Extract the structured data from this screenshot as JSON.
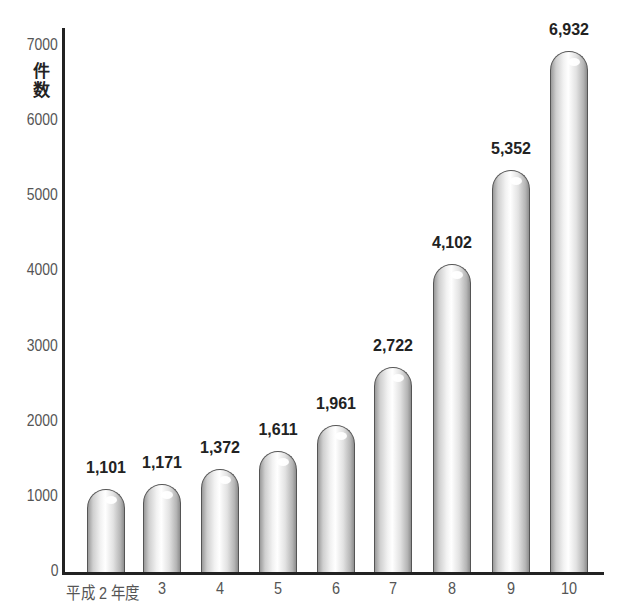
{
  "chart_data": {
    "type": "bar",
    "title": "",
    "xlabel": "",
    "ylabel": "件数",
    "ylim": [
      0,
      7000
    ],
    "yticks": [
      0,
      1000,
      2000,
      3000,
      4000,
      5000,
      6000,
      7000
    ],
    "categories": [
      "平成2年度",
      "3",
      "4",
      "5",
      "6",
      "7",
      "8",
      "9",
      "10"
    ],
    "values": [
      1101,
      1171,
      1372,
      1611,
      1961,
      2722,
      4102,
      5352,
      6932
    ],
    "value_labels": [
      "1,101",
      "1,171",
      "1,372",
      "1,611",
      "1,961",
      "2,722",
      "4,102",
      "5,352",
      "6,932"
    ],
    "grid": false,
    "legend": null,
    "style": "rounded cylindrical gray bars"
  },
  "axis": {
    "ylabel_chars": [
      "件",
      "数"
    ],
    "ytick_labels": [
      "0",
      "1000",
      "2000",
      "3000",
      "4000",
      "5000",
      "6000",
      "7000"
    ],
    "xtick_labels": [
      "平成 2 年度",
      "3",
      "4",
      "5",
      "6",
      "7",
      "8",
      "9",
      "10"
    ]
  }
}
